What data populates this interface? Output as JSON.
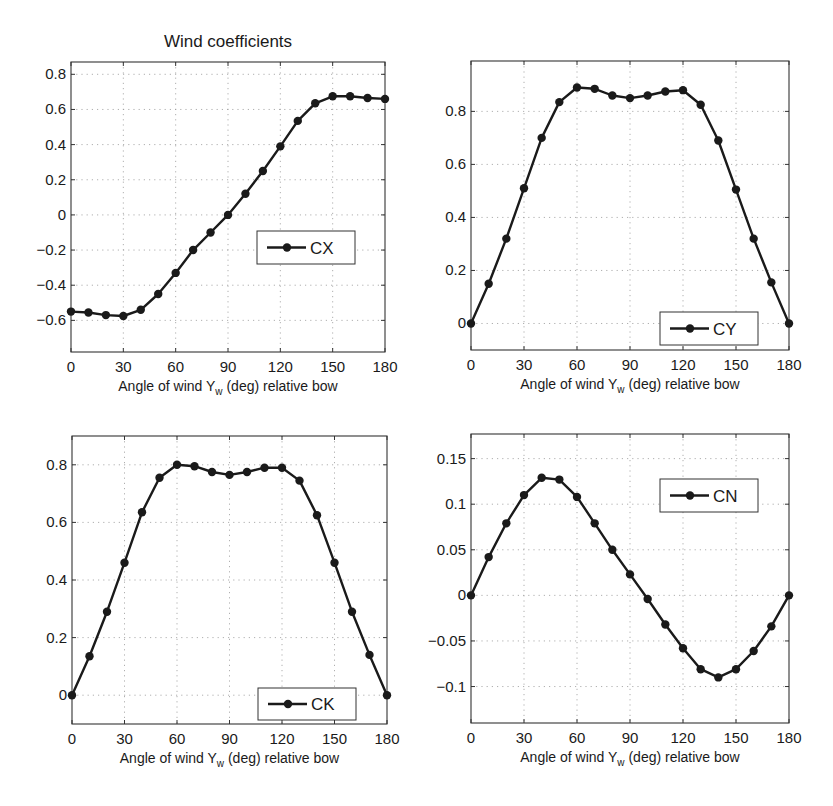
{
  "figure": {
    "title": "Wind coefficients",
    "background": "#ffffff",
    "line_color": "#1a1a1a",
    "grid_color": "#9a9a9a"
  },
  "chart_data": [
    {
      "type": "line",
      "id": "cx",
      "title": "Wind coefficients",
      "xlabel": "Angle of wind Y_w (deg) relative bow",
      "xlabel_main": "Angle of wind Y",
      "xlabel_sub": "w",
      "xlabel_rest": " (deg) relative bow",
      "ylabel": "",
      "x": [
        0,
        10,
        20,
        30,
        40,
        50,
        60,
        70,
        80,
        90,
        100,
        110,
        120,
        130,
        140,
        150,
        160,
        170,
        180
      ],
      "series": [
        {
          "name": "CX",
          "values": [
            -0.55,
            -0.555,
            -0.57,
            -0.575,
            -0.54,
            -0.45,
            -0.33,
            -0.2,
            -0.1,
            0.0,
            0.12,
            0.25,
            0.39,
            0.535,
            0.635,
            0.675,
            0.675,
            0.665,
            0.66
          ]
        }
      ],
      "xticks": [
        0,
        30,
        60,
        90,
        120,
        150,
        180
      ],
      "xtick_labels": [
        "0",
        "30",
        "60",
        "90",
        "120",
        "150",
        "180"
      ],
      "yticks": [
        -0.6,
        -0.4,
        -0.2,
        0,
        0.2,
        0.4,
        0.6,
        0.8
      ],
      "ytick_labels": [
        "−0.6",
        "−0.4",
        "−0.2",
        "0",
        "0.2",
        "0.4",
        "0.6",
        "0.8"
      ],
      "xlim": [
        0,
        180
      ],
      "ylim": [
        -0.78,
        0.87
      ],
      "grid": true,
      "legend": {
        "label": "CX",
        "position": "center-right",
        "box": [
          257,
          231,
          98,
          33
        ]
      },
      "box": [
        71,
        62,
        385,
        352
      ]
    },
    {
      "type": "line",
      "id": "cy",
      "title": "",
      "xlabel": "Angle of wind Y_w (deg) relative bow",
      "xlabel_main": "Angle of wind Y",
      "xlabel_sub": "w",
      "xlabel_rest": " (deg) relative bow",
      "ylabel": "",
      "x": [
        0,
        10,
        20,
        30,
        40,
        50,
        60,
        70,
        80,
        90,
        100,
        110,
        120,
        130,
        140,
        150,
        160,
        170,
        180
      ],
      "series": [
        {
          "name": "CY",
          "values": [
            0.0,
            0.15,
            0.32,
            0.51,
            0.7,
            0.835,
            0.89,
            0.885,
            0.86,
            0.85,
            0.86,
            0.875,
            0.88,
            0.825,
            0.69,
            0.505,
            0.32,
            0.155,
            0.0
          ]
        }
      ],
      "xticks": [
        0,
        30,
        60,
        90,
        120,
        150,
        180
      ],
      "xtick_labels": [
        "0",
        "30",
        "60",
        "90",
        "120",
        "150",
        "180"
      ],
      "yticks": [
        0,
        0.2,
        0.4,
        0.6,
        0.8
      ],
      "ytick_labels": [
        "0",
        "0.2",
        "0.4",
        "0.6",
        "0.8"
      ],
      "xlim": [
        0,
        180
      ],
      "ylim": [
        -0.1,
        0.99
      ],
      "grid": true,
      "legend": {
        "label": "CY",
        "position": "lower-right",
        "box": [
          660,
          312,
          98,
          33
        ]
      },
      "box": [
        471,
        61,
        789,
        350
      ]
    },
    {
      "type": "line",
      "id": "ck",
      "title": "",
      "xlabel": "Angle of wind Y_w (deg) relative bow",
      "xlabel_main": "Angle of wind Y",
      "xlabel_sub": "w",
      "xlabel_rest": " (deg) relative bow",
      "ylabel": "",
      "x": [
        0,
        10,
        20,
        30,
        40,
        50,
        60,
        70,
        80,
        90,
        100,
        110,
        120,
        130,
        140,
        150,
        160,
        170,
        180
      ],
      "series": [
        {
          "name": "CK",
          "values": [
            0.0,
            0.135,
            0.29,
            0.46,
            0.635,
            0.755,
            0.8,
            0.795,
            0.775,
            0.765,
            0.775,
            0.79,
            0.79,
            0.745,
            0.625,
            0.46,
            0.29,
            0.14,
            0.0
          ]
        }
      ],
      "xticks": [
        0,
        30,
        60,
        90,
        120,
        150,
        180
      ],
      "xtick_labels": [
        "0",
        "30",
        "60",
        "90",
        "120",
        "150",
        "180"
      ],
      "yticks": [
        0,
        0.2,
        0.4,
        0.6,
        0.8
      ],
      "ytick_labels": [
        "0",
        "0.2",
        "0.4",
        "0.6",
        "0.8"
      ],
      "xlim": [
        0,
        180
      ],
      "ylim": [
        -0.1,
        0.9
      ],
      "grid": true,
      "legend": {
        "label": "CK",
        "position": "lower-right",
        "box": [
          258,
          688,
          98,
          32
        ]
      },
      "box": [
        72,
        436,
        387,
        724
      ]
    },
    {
      "type": "line",
      "id": "cn",
      "title": "",
      "xlabel": "Angle of wind Y_w (deg) relative bow",
      "xlabel_main": "Angle of wind Y",
      "xlabel_sub": "w",
      "xlabel_rest": " (deg) relative bow",
      "ylabel": "",
      "x": [
        0,
        10,
        20,
        30,
        40,
        50,
        60,
        70,
        80,
        90,
        100,
        110,
        120,
        130,
        140,
        150,
        160,
        170,
        180
      ],
      "series": [
        {
          "name": "CN",
          "values": [
            0.0,
            0.042,
            0.079,
            0.11,
            0.129,
            0.127,
            0.108,
            0.079,
            0.05,
            0.023,
            -0.004,
            -0.032,
            -0.058,
            -0.081,
            -0.09,
            -0.081,
            -0.061,
            -0.034,
            0.0
          ]
        }
      ],
      "xticks": [
        0,
        30,
        60,
        90,
        120,
        150,
        180
      ],
      "xtick_labels": [
        "0",
        "30",
        "60",
        "90",
        "120",
        "150",
        "180"
      ],
      "yticks": [
        -0.1,
        -0.05,
        0,
        0.05,
        0.1,
        0.15
      ],
      "ytick_labels": [
        "−0.1",
        "−0.05",
        "0",
        "0.05",
        "0.1",
        "0.15"
      ],
      "xlim": [
        0,
        180
      ],
      "ylim": [
        -0.14,
        0.177
      ],
      "grid": true,
      "legend": {
        "label": "CN",
        "position": "upper-right",
        "box": [
          660,
          479,
          98,
          33
        ]
      },
      "box": [
        471,
        434,
        789,
        723
      ]
    }
  ]
}
